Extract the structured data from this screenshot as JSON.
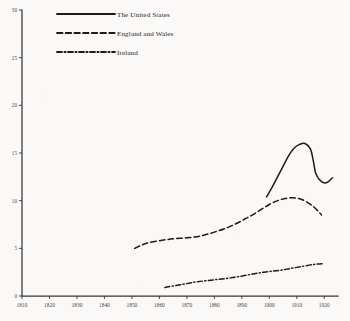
{
  "chart_data": {
    "type": "line",
    "title": "",
    "subtitle": "",
    "xlabel": "",
    "ylabel": "",
    "xlim": [
      1810,
      1925
    ],
    "ylim": [
      0,
      30
    ],
    "grid": false,
    "legend_position": "top-left",
    "x_ticks": [
      "1810",
      "1820",
      "1830",
      "1840",
      "1850",
      "1860",
      "1870",
      "1880",
      "1890",
      "1900",
      "1910",
      "1920"
    ],
    "x_tick_values": [
      1810,
      1820,
      1830,
      1840,
      1850,
      1860,
      1870,
      1880,
      1890,
      1900,
      1910,
      1920
    ],
    "y_ticks": [
      "0",
      "5",
      "10",
      "15",
      "20",
      "25",
      "30"
    ],
    "y_tick_values": [
      0,
      5,
      10,
      15,
      20,
      25,
      30
    ],
    "series": [
      {
        "name": "The United States",
        "style": "solid",
        "color": "#1d1a18",
        "x": [
          1899,
          1901,
          1903,
          1905,
          1907,
          1909,
          1911,
          1913,
          1915,
          1916,
          1917,
          1919,
          1921,
          1923
        ],
        "values": [
          10.4,
          11.4,
          12.5,
          13.6,
          14.7,
          15.5,
          15.9,
          16.0,
          15.4,
          14.2,
          12.8,
          12.0,
          11.9,
          12.4
        ]
      },
      {
        "name": "England and Wales",
        "style": "dashed",
        "color": "#1d1a18",
        "x": [
          1851,
          1855,
          1860,
          1865,
          1870,
          1875,
          1880,
          1885,
          1890,
          1895,
          1900,
          1904,
          1908,
          1912,
          1916,
          1919
        ],
        "values": [
          5.0,
          5.5,
          5.8,
          6.0,
          6.1,
          6.3,
          6.7,
          7.2,
          7.9,
          8.7,
          9.6,
          10.1,
          10.3,
          10.1,
          9.4,
          8.5
        ]
      },
      {
        "name": "Ireland",
        "style": "dashdot",
        "color": "#1d1a18",
        "x": [
          1862,
          1868,
          1874,
          1880,
          1886,
          1892,
          1898,
          1904,
          1910,
          1916,
          1920
        ],
        "values": [
          0.9,
          1.2,
          1.5,
          1.7,
          1.9,
          2.2,
          2.5,
          2.7,
          3.0,
          3.3,
          3.4
        ]
      }
    ]
  },
  "legend": {
    "entries": [
      {
        "label": "The United States",
        "style": "solid"
      },
      {
        "label": "England and Wales",
        "style": "dashed"
      },
      {
        "label": "Ireland",
        "style": "dashdot"
      }
    ]
  }
}
